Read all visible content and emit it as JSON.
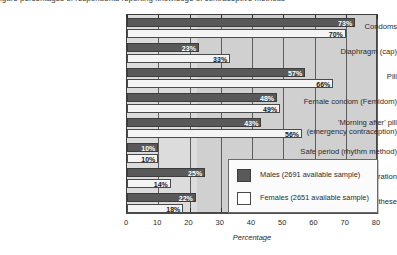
{
  "top_caption_fragment": "igure  percentages of respondents reporting knowledge of contraceptive methods",
  "chart_data": {
    "type": "bar",
    "orientation": "horizontal",
    "title": "",
    "xlabel": "Percentage",
    "ylabel": "",
    "xlim": [
      0,
      80
    ],
    "xticks": [
      0,
      10,
      20,
      30,
      40,
      50,
      60,
      70,
      80
    ],
    "xtick_labels": [
      "0",
      "10",
      "20",
      "30",
      "40",
      "50",
      "60",
      "70",
      "80"
    ],
    "grid": true,
    "legend_position": "lower-right",
    "categories": [
      "Condoms",
      "Diaphragm (cap)",
      "Pill",
      "Female condom (Femidom)",
      "'Morning after' pill\n(emergency contraception)",
      "Safe period (rhythm method)",
      "Sex without penetration",
      "None of these"
    ],
    "series": [
      {
        "name": "Males (2691 available sample)",
        "color": "#595959",
        "values": [
          73,
          23,
          57,
          48,
          43,
          10,
          25,
          22
        ],
        "value_labels": [
          "73%",
          "23%",
          "57%",
          "48%",
          "43%",
          "10%",
          "25%",
          "22%"
        ]
      },
      {
        "name": "Females (2651 available sample)",
        "color": "#f4f4f4",
        "values": [
          70,
          33,
          66,
          49,
          56,
          10,
          14,
          18
        ],
        "value_labels": [
          "70%",
          "33%",
          "66%",
          "49%",
          "56%",
          "10%",
          "14%",
          "18%"
        ]
      }
    ]
  },
  "legend": {
    "entries": [
      {
        "label": "Males (2691 available sample)",
        "swatch": "male"
      },
      {
        "label": "Females (2651 available sample)",
        "swatch": "female"
      }
    ]
  }
}
